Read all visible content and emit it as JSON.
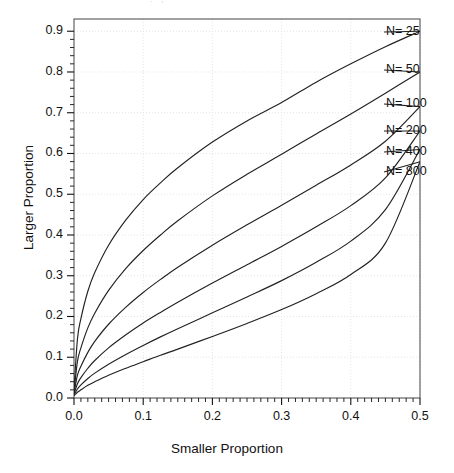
{
  "figure": {
    "scan_artifact": ". ,",
    "background": "#ffffff",
    "line_color": "#222222",
    "grid_color": "#e4e4e4",
    "axis_color": "#555555"
  },
  "chart_data": {
    "type": "line",
    "title": "",
    "xlabel": "Smaller Proportion",
    "ylabel": "Larger Proportion",
    "xlim": [
      0.0,
      0.5
    ],
    "ylim": [
      0.0,
      0.93
    ],
    "xticks": [
      "0.0",
      "0.1",
      "0.2",
      "0.3",
      "0.4",
      "0.5"
    ],
    "xtick_values": [
      0.0,
      0.1,
      0.2,
      0.3,
      0.4,
      0.5
    ],
    "yticks": [
      "0.0",
      "0.1",
      "0.2",
      "0.3",
      "0.4",
      "0.5",
      "0.6",
      "0.7",
      "0.8",
      "0.9"
    ],
    "ytick_values": [
      0.0,
      0.1,
      0.2,
      0.3,
      0.4,
      0.5,
      0.6,
      0.7,
      0.8,
      0.9
    ],
    "minor_tick_step_x": 0.01,
    "minor_tick_step_y": 0.02,
    "grid": true,
    "legend_position": "inline-right-annotations",
    "x": [
      0.0,
      0.005,
      0.01,
      0.02,
      0.03,
      0.05,
      0.075,
      0.1,
      0.125,
      0.15,
      0.2,
      0.25,
      0.3,
      0.35,
      0.4,
      0.45,
      0.5
    ],
    "series": [
      {
        "name": "N= 25",
        "label": "N= 25",
        "n": 25,
        "values": [
          0.02,
          0.145,
          0.195,
          0.262,
          0.308,
          0.375,
          0.437,
          0.487,
          0.528,
          0.565,
          0.628,
          0.68,
          0.725,
          0.775,
          0.82,
          0.862,
          0.9
        ]
      },
      {
        "name": "N= 50",
        "label": "N= 50",
        "n": 50,
        "values": [
          0.015,
          0.09,
          0.123,
          0.172,
          0.208,
          0.264,
          0.318,
          0.362,
          0.4,
          0.435,
          0.496,
          0.549,
          0.598,
          0.648,
          0.697,
          0.748,
          0.8
        ]
      },
      {
        "name": "N= 100",
        "label": "N= 100",
        "n": 100,
        "values": [
          0.012,
          0.056,
          0.078,
          0.112,
          0.139,
          0.181,
          0.223,
          0.259,
          0.291,
          0.321,
          0.375,
          0.425,
          0.473,
          0.522,
          0.572,
          0.63,
          0.715
        ]
      },
      {
        "name": "N= 200",
        "label": "N= 200",
        "n": 200,
        "values": [
          0.01,
          0.035,
          0.05,
          0.073,
          0.092,
          0.123,
          0.155,
          0.184,
          0.21,
          0.235,
          0.282,
          0.327,
          0.372,
          0.42,
          0.472,
          0.54,
          0.655
        ]
      },
      {
        "name": "N= 400",
        "label": "N= 400",
        "n": 400,
        "values": [
          0.008,
          0.022,
          0.032,
          0.048,
          0.061,
          0.083,
          0.107,
          0.129,
          0.15,
          0.17,
          0.209,
          0.248,
          0.288,
          0.333,
          0.385,
          0.462,
          0.61
        ]
      },
      {
        "name": "N= 800",
        "label": "N= 800",
        "n": 800,
        "values": [
          0.006,
          0.014,
          0.02,
          0.031,
          0.04,
          0.056,
          0.073,
          0.089,
          0.105,
          0.12,
          0.151,
          0.183,
          0.217,
          0.256,
          0.303,
          0.38,
          0.58
        ]
      }
    ],
    "annotations": [
      {
        "text": "N= 25",
        "x": 0.5,
        "y": 0.9
      },
      {
        "text": "N= 50",
        "x": 0.5,
        "y": 0.8
      },
      {
        "text": "N= 100",
        "x": 0.5,
        "y": 0.715
      },
      {
        "text": "N= 200",
        "x": 0.5,
        "y": 0.655
      },
      {
        "text": "N= 400",
        "x": 0.5,
        "y": 0.61
      },
      {
        "text": "N= 800",
        "x": 0.5,
        "y": 0.58
      }
    ]
  }
}
